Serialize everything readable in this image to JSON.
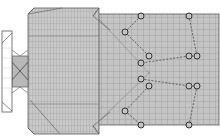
{
  "diagram": {
    "type": "structural-plan",
    "colors": {
      "background": "#ffffff",
      "fill": "#c4c4c4",
      "grid": "#8a8a8a",
      "outline": "#5a5a5a",
      "diagonal": "#6e6e6e",
      "node_stroke": "#333333",
      "dash": "#555555"
    },
    "blocks": [
      {
        "name": "main-block",
        "x": 28,
        "y": 8,
        "w": 71,
        "h": 126
      },
      {
        "name": "extension-grid",
        "x": 97,
        "y": 14,
        "w": 122,
        "h": 111
      },
      {
        "name": "annex-strip",
        "x": 2,
        "y": 31,
        "w": 10,
        "h": 81
      },
      {
        "name": "connector",
        "x": 12,
        "y": 50,
        "w": 16,
        "h": 43
      }
    ],
    "nodes": [
      {
        "id": 1,
        "x": 141,
        "y": 16
      },
      {
        "id": 2,
        "x": 189,
        "y": 16
      },
      {
        "id": 3,
        "x": 125,
        "y": 32
      },
      {
        "id": 4,
        "x": 149,
        "y": 56
      },
      {
        "id": 5,
        "x": 189,
        "y": 56
      },
      {
        "id": 6,
        "x": 197,
        "y": 56
      },
      {
        "id": 7,
        "x": 141,
        "y": 63
      },
      {
        "id": 8,
        "x": 141,
        "y": 79
      },
      {
        "id": 9,
        "x": 149,
        "y": 86
      },
      {
        "id": 10,
        "x": 189,
        "y": 86
      },
      {
        "id": 11,
        "x": 197,
        "y": 86
      },
      {
        "id": 12,
        "x": 125,
        "y": 111
      },
      {
        "id": 13,
        "x": 141,
        "y": 125
      },
      {
        "id": 14,
        "x": 189,
        "y": 125
      }
    ],
    "links": [
      [
        1,
        3
      ],
      [
        3,
        4
      ],
      [
        2,
        6
      ],
      [
        6,
        5
      ],
      [
        5,
        7
      ],
      [
        8,
        10
      ],
      [
        10,
        11
      ],
      [
        11,
        14
      ],
      [
        9,
        12
      ],
      [
        12,
        13
      ]
    ]
  }
}
